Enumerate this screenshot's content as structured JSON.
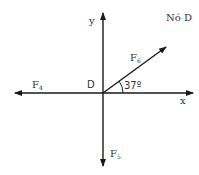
{
  "title": "Nó D",
  "node_label": "D",
  "axes": {
    "x_label": "x",
    "y_label": "y"
  },
  "forces": [
    {
      "name": "F",
      "sub": "4",
      "direction": "left (negative x)"
    },
    {
      "name": "F",
      "sub": "5",
      "direction": "down (negative y)"
    },
    {
      "name": "F",
      "sub": "6",
      "direction": "37° above positive x"
    }
  ],
  "angle_label": "37º",
  "colors": {
    "stroke": "#1a1a1a",
    "text": "#333333",
    "background": "#ffffff"
  }
}
